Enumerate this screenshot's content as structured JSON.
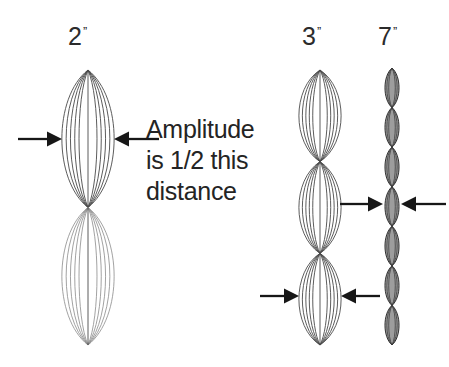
{
  "figure": {
    "title_text_visible": false,
    "background_color": "#ffffff",
    "ink_color": "#2b2b2b"
  },
  "annotation": {
    "lines": [
      "Amplitude",
      "is 1/2 this",
      "distance"
    ],
    "full_text": "Amplitude is 1/2 this distance"
  },
  "columns": [
    {
      "label": "2",
      "prime": "ˮ",
      "label_text": "2ˮ",
      "name": "harmonic-2",
      "lobes": 2,
      "style": "outline",
      "center_x": 88,
      "top_y": 70,
      "bottom_y": 345,
      "max_half_width": 26,
      "nested_curves": 5,
      "arrow_row_y": 139
    },
    {
      "label": "3",
      "prime": "ˮ",
      "label_text": "3ˮ",
      "name": "harmonic-3",
      "lobes": 3,
      "style": "outline",
      "center_x": 320,
      "top_y": 70,
      "bottom_y": 345,
      "max_half_width": 21,
      "nested_curves": 5,
      "arrow_row_y": 296
    },
    {
      "label": "7",
      "prime": "ˮ",
      "label_text": "7ˮ",
      "name": "harmonic-7",
      "lobes": 7,
      "style": "filled",
      "center_x": 392,
      "top_y": 68,
      "bottom_y": 345,
      "max_half_width": 7,
      "nested_curves": 3,
      "arrow_row_y": 204
    }
  ],
  "arrow_pairs": [
    {
      "name": "amplitude-arrows-harmonic-2",
      "y": 139,
      "left_arrow": {
        "shaft_from_x": 18,
        "tip_x": 62,
        "direction": "right"
      },
      "right_arrow": {
        "shaft_from_x": 159,
        "tip_x": 114,
        "direction": "left"
      },
      "measures": "harmonic-2"
    },
    {
      "name": "amplitude-arrows-harmonic-3",
      "y": 296,
      "left_arrow": {
        "shaft_from_x": 260,
        "tip_x": 299,
        "direction": "right"
      },
      "right_arrow": {
        "shaft_from_x": 380,
        "tip_x": 341,
        "direction": "left"
      },
      "measures": "harmonic-3"
    },
    {
      "name": "amplitude-arrows-harmonic-7",
      "y": 204,
      "left_arrow": {
        "shaft_from_x": 340,
        "tip_x": 383,
        "direction": "right"
      },
      "right_arrow": {
        "shaft_from_x": 446,
        "tip_x": 401,
        "direction": "left"
      },
      "measures": "harmonic-7"
    }
  ],
  "label_positions": [
    {
      "for": "harmonic-2",
      "left": 68,
      "top": 24
    },
    {
      "for": "harmonic-3",
      "left": 302,
      "top": 24
    },
    {
      "for": "harmonic-7",
      "left": 378,
      "top": 24
    }
  ]
}
